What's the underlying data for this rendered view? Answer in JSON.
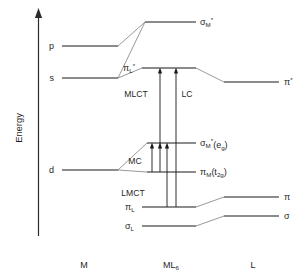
{
  "figure": {
    "axis": {
      "label": "Energy",
      "arrow_direction": "up"
    },
    "columns": [
      {
        "id": "metal",
        "label": "M",
        "x": 84
      },
      {
        "id": "complex",
        "label": "ML",
        "label_sub": "6",
        "x": 170
      },
      {
        "id": "ligand",
        "label": "L",
        "x": 253
      }
    ]
  },
  "levels": {
    "metal": [
      {
        "name": "p",
        "label": "p",
        "y": 46
      },
      {
        "name": "s",
        "label": "s",
        "y": 78
      },
      {
        "name": "d",
        "label": "d",
        "y": 170
      }
    ],
    "complex": [
      {
        "name": "sigma-M-star",
        "label": "σ",
        "sub": "M",
        "sup": "*",
        "paren": "",
        "y": 22
      },
      {
        "name": "pi-L-star",
        "label": "π",
        "sub": "L",
        "sup": "*",
        "paren": "",
        "y": 68
      },
      {
        "name": "sigma-M-star-eg",
        "label": "σ",
        "sub": "M",
        "sup": "*",
        "paren": "(e",
        "paren_sub": "g",
        "paren_end": ")",
        "y": 143
      },
      {
        "name": "pi-M-t2g",
        "label": "π",
        "sub": "M",
        "sup": "",
        "paren": "(t",
        "paren_sub": "2g",
        "paren_end": ")",
        "y": 172
      },
      {
        "name": "pi-L",
        "label": "π",
        "sub": "L",
        "sup": "",
        "paren": "",
        "y": 207
      },
      {
        "name": "sigma-L",
        "label": "σ",
        "sub": "L",
        "sup": "",
        "paren": "",
        "y": 226
      }
    ],
    "ligand": [
      {
        "name": "pi-star",
        "label": "π",
        "sup": "*",
        "y": 82
      },
      {
        "name": "pi",
        "label": "π",
        "sup": "",
        "y": 197
      },
      {
        "name": "sigma",
        "label": "σ",
        "sup": "",
        "y": 216
      }
    ]
  },
  "transitions": [
    {
      "name": "MLCT",
      "label": "MLCT",
      "from": "pi-M-t2g",
      "to": "pi-L-star",
      "x": 158,
      "label_x": 135,
      "label_y": 94
    },
    {
      "name": "LC",
      "label": "LC",
      "from": "pi-L",
      "to": "pi-L-star",
      "x": 176,
      "label_x": 183,
      "label_y": 94
    },
    {
      "name": "MC",
      "label": "MC",
      "from": "pi-M-t2g",
      "to": "sigma-M-star-eg",
      "x": 152,
      "label_x": 131,
      "label_y": 161
    },
    {
      "name": "LMCT",
      "label": "LMCT",
      "from": "pi-L",
      "to": "sigma-M-star-eg",
      "x": 167,
      "label_x": 128,
      "label_y": 193
    }
  ],
  "colors": {
    "level_line": "#1a1a1a",
    "correlation_line": "#7d7d7d",
    "axis": "#2b2b2b",
    "arrow": "#1a1a1a",
    "background": "#ffffff"
  }
}
